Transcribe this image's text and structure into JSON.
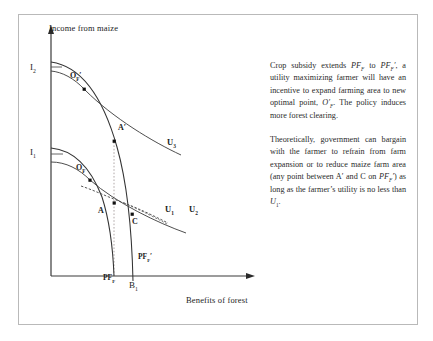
{
  "figure": {
    "axes": {
      "y_axis_title": "Income from maize",
      "x_axis_title": "Benefits of forest",
      "y_ticks": [
        {
          "id": "I2",
          "base": "I",
          "sub": "2"
        },
        {
          "id": "I1",
          "base": "I",
          "sub": "1"
        }
      ],
      "x_ticks": [
        {
          "id": "B1",
          "base": "B",
          "sub": "1"
        }
      ]
    },
    "points": [
      {
        "id": "OF-prime",
        "base": "O",
        "sub": "F",
        "prime": "'",
        "label": "O_F'"
      },
      {
        "id": "A-prime",
        "base": "A",
        "sub": "",
        "prime": "'",
        "label": "A'"
      },
      {
        "id": "OF",
        "base": "O",
        "sub": "F",
        "prime": "",
        "label": "O_F"
      },
      {
        "id": "A",
        "base": "A",
        "sub": "",
        "prime": "",
        "label": "A"
      },
      {
        "id": "C",
        "base": "C",
        "sub": "",
        "prime": "",
        "label": "C"
      }
    ],
    "indifference_curves": [
      {
        "id": "U1",
        "base": "U",
        "sub": "1"
      },
      {
        "id": "U2",
        "base": "U",
        "sub": "2"
      },
      {
        "id": "U3",
        "base": "U",
        "sub": "3"
      }
    ],
    "production_frontiers": [
      {
        "id": "PFF",
        "base": "PF",
        "sub": "F",
        "prime": ""
      },
      {
        "id": "PFF-prime",
        "base": "PF",
        "sub": "F",
        "prime": "'"
      }
    ]
  },
  "text": {
    "paragraph1_html": "Crop subsidy extends <i>PF<sub>F</sub></i> to <i>PF<sub>F</sub>&#8242;</i>, a utility maximizing farmer will have an incentive to expand farming area to new optimal point, <i>O&#8242;<sub>F</sub></i>. The policy induces more forest clearing.",
    "paragraph2_html": "Theoretically, government can bargain with the farmer to refrain from farm expansion or to reduce maize farm area (any point between A&#8242; and C on <i>PF<sub>F</sub>&#8242;</i>) as long as the farmer&#8217;s utility is no less than <i>U</i><sub>1</sub>."
  },
  "chart_data": {
    "type": "line",
    "title": "",
    "xlabel": "Benefits of forest",
    "ylabel": "Income from maize",
    "grid": false,
    "legend": "inline-curve-labels",
    "xlim": [
      0,
      248
    ],
    "ylim": [
      0,
      311
    ],
    "annotations": [
      {
        "name": "I2",
        "kind": "y-tick",
        "text": "I2"
      },
      {
        "name": "I1",
        "kind": "y-tick",
        "text": "I1"
      },
      {
        "name": "B1",
        "kind": "x-tick",
        "text": "B1"
      },
      {
        "name": "OF-prime",
        "kind": "point",
        "text": "O_F'"
      },
      {
        "name": "A-prime",
        "kind": "point",
        "text": "A'"
      },
      {
        "name": "OF",
        "kind": "point",
        "text": "O_F"
      },
      {
        "name": "A",
        "kind": "point",
        "text": "A"
      },
      {
        "name": "C",
        "kind": "point",
        "text": "C"
      },
      {
        "name": "U1",
        "kind": "curve-label",
        "text": "U1"
      },
      {
        "name": "U2",
        "kind": "curve-label",
        "text": "U2"
      },
      {
        "name": "U3",
        "kind": "curve-label",
        "text": "U3"
      },
      {
        "name": "PFF",
        "kind": "curve-label",
        "text": "PF_F"
      },
      {
        "name": "PFF-prime",
        "kind": "curve-label",
        "text": "PF_F'"
      }
    ],
    "series": [
      {
        "name": "PF_F",
        "kind": "production-possibility-frontier",
        "points": [
          [
            33,
            134
          ],
          [
            45,
            139
          ],
          [
            60,
            152
          ],
          [
            75,
            175
          ],
          [
            85,
            202
          ],
          [
            92,
            235
          ],
          [
            96,
            262
          ]
        ]
      },
      {
        "name": "PF_F-prime",
        "kind": "production-possibility-frontier-shifted",
        "points": [
          [
            33,
            48
          ],
          [
            50,
            57
          ],
          [
            68,
            77
          ],
          [
            86,
            112
          ],
          [
            99,
            150
          ],
          [
            108,
            200
          ],
          [
            113,
            248
          ],
          [
            115,
            267
          ]
        ]
      },
      {
        "name": "U1",
        "kind": "indifference-curve",
        "points": [
          [
            33,
            155
          ],
          [
            60,
            165
          ],
          [
            90,
            180
          ],
          [
            120,
            196
          ],
          [
            150,
            211
          ]
        ]
      },
      {
        "name": "U2",
        "kind": "indifference-curve",
        "points": [
          [
            33,
            150
          ],
          [
            65,
            164
          ],
          [
            100,
            182
          ],
          [
            135,
            200
          ],
          [
            168,
            216
          ]
        ]
      },
      {
        "name": "U3",
        "kind": "indifference-curve",
        "points": [
          [
            33,
            62
          ],
          [
            70,
            80
          ],
          [
            105,
            103
          ],
          [
            140,
            124
          ],
          [
            163,
            139
          ]
        ]
      }
    ]
  }
}
